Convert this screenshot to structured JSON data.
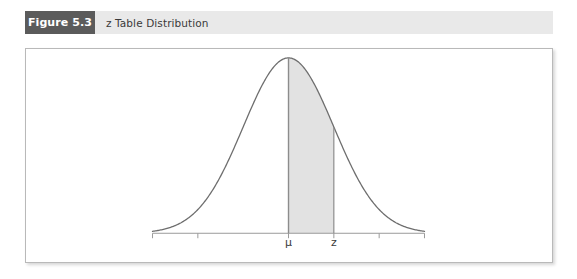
{
  "figure": {
    "number_label": "Figure 5.3",
    "caption": "z Table Distribution"
  },
  "colors": {
    "number_box_bg": "#5b5b5b",
    "header_bg": "#e9e9e9",
    "caption_text": "#3a3a3a",
    "panel_bg": "#ffffff",
    "panel_border": "#b9b9b9",
    "curve_stroke": "#6e6e6e",
    "shade_fill": "#e2e2e2",
    "axis_stroke": "#9a9a9a",
    "marker_line": "#8c8c8c"
  },
  "chart_data": {
    "type": "line",
    "title": "z Table Distribution",
    "xlabel": "",
    "ylabel": "",
    "grid": false,
    "legend_position": "none",
    "distribution": "standard normal density",
    "x_axis": {
      "min_z": -3.0,
      "max_z": 3.0,
      "tick_z_values": [
        -3.0,
        -2.0,
        0.0,
        1.0,
        2.0,
        3.0
      ],
      "tick_labels": [
        "",
        "",
        "μ",
        "z",
        "",
        ""
      ]
    },
    "annotations": [
      {
        "name": "mean-line",
        "label": "μ",
        "z": 0.0,
        "type": "vertical-line-to-curve"
      },
      {
        "name": "z-line",
        "label": "z",
        "z": 1.0,
        "type": "vertical-line-to-curve"
      }
    ],
    "shaded_region": {
      "label": "area between μ and z",
      "from_z": 0.0,
      "to_z": 1.0,
      "fill": "#e2e2e2"
    },
    "x": [
      -3.0,
      -2.8,
      -2.6,
      -2.4,
      -2.2,
      -2.0,
      -1.8,
      -1.6,
      -1.4,
      -1.2,
      -1.0,
      -0.8,
      -0.6,
      -0.4,
      -0.2,
      0.0,
      0.2,
      0.4,
      0.6,
      0.8,
      1.0,
      1.2,
      1.4,
      1.6,
      1.8,
      2.0,
      2.2,
      2.4,
      2.6,
      2.8,
      3.0
    ],
    "y": [
      0.0044,
      0.0079,
      0.0136,
      0.0224,
      0.0355,
      0.054,
      0.079,
      0.1109,
      0.1497,
      0.1942,
      0.242,
      0.2897,
      0.3332,
      0.3683,
      0.391,
      0.3989,
      0.391,
      0.3683,
      0.3332,
      0.2897,
      0.242,
      0.1942,
      0.1497,
      0.1109,
      0.079,
      0.054,
      0.0355,
      0.0224,
      0.0136,
      0.0079,
      0.0044
    ],
    "axis_labels_shown": [
      "μ",
      "z"
    ]
  },
  "axis": {
    "mu_label": "μ",
    "z_label": "z"
  }
}
